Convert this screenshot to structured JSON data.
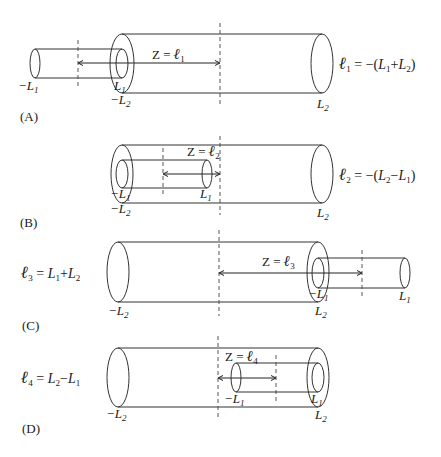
{
  "panels": [
    {
      "id": "A",
      "panel_label": "(A)",
      "z_label": "Z = ℓ",
      "z_sub": "1",
      "formula": {
        "main": "ℓ",
        "sub": "1",
        "rest": " = −(L",
        "sub2": "1",
        "plus": "+L",
        "sub3": "2",
        "close": ")"
      },
      "labels": {
        "neg_L1": "−L",
        "neg_L1_sub": "1",
        "L1": "L",
        "L1_sub": "1",
        "neg_L2": "−L",
        "neg_L2_sub": "2",
        "L2": "L",
        "L2_sub": "2"
      }
    },
    {
      "id": "B",
      "panel_label": "(B)",
      "z_label": "Z = ℓ",
      "z_sub": "2",
      "formula": {
        "main": "ℓ",
        "sub": "2",
        "rest": " = −(L",
        "sub2": "2",
        "plus": "−L",
        "sub3": "1",
        "close": ")"
      },
      "labels": {
        "neg_L1": "−L",
        "neg_L1_sub": "1",
        "L1": "L",
        "L1_sub": "1",
        "neg_L2": "−L",
        "neg_L2_sub": "2",
        "L2": "L",
        "L2_sub": "2"
      }
    },
    {
      "id": "C",
      "panel_label": "(C)",
      "z_label": "Z = ℓ",
      "z_sub": "3",
      "formula": {
        "main": "ℓ",
        "sub": "3",
        "rest": " =  L",
        "sub2": "1",
        "plus": "+L",
        "sub3": "2",
        "close": ""
      },
      "labels": {
        "neg_L1": "−L",
        "neg_L1_sub": "1",
        "L1": "L",
        "L1_sub": "1",
        "neg_L2": "−L",
        "neg_L2_sub": "2",
        "L2": "L",
        "L2_sub": "2"
      }
    },
    {
      "id": "D",
      "panel_label": "(D)",
      "z_label": "Z = ℓ",
      "z_sub": "4",
      "formula": {
        "main": "ℓ",
        "sub": "4",
        "rest": " = L",
        "sub2": "2",
        "plus": "−L",
        "sub3": "1",
        "close": ""
      },
      "labels": {
        "neg_L1": "−L",
        "neg_L1_sub": "1",
        "L1": "L",
        "L1_sub": "1",
        "neg_L2": "−L",
        "neg_L2_sub": "2",
        "L2": "L",
        "L2_sub": "2"
      }
    }
  ]
}
